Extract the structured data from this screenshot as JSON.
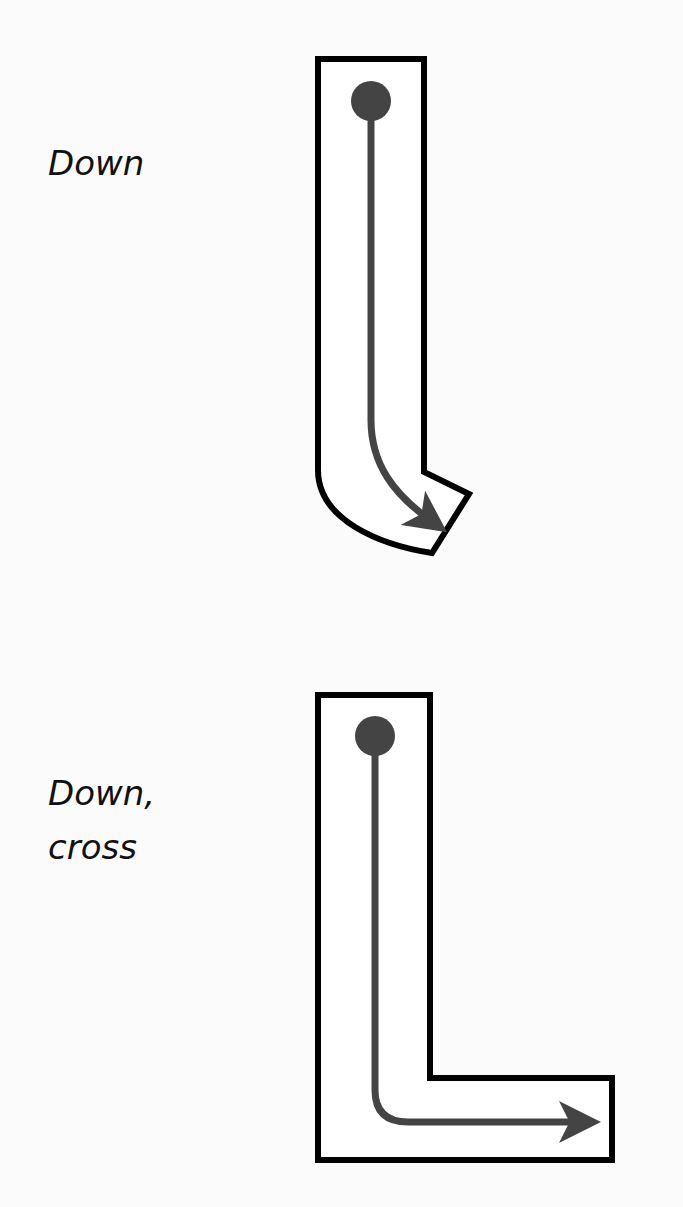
{
  "gestures": [
    {
      "label": "Down",
      "shape": "j-hook",
      "path_direction": "down then curving right-down",
      "stroke_color": "#000000",
      "arrow_color": "#444444"
    },
    {
      "label_lines": [
        "Down,",
        "cross"
      ],
      "shape": "l-shape",
      "path_direction": "down then right",
      "stroke_color": "#000000",
      "arrow_color": "#444444"
    }
  ],
  "colors": {
    "background": "#fbfbfb",
    "outline": "#000000",
    "fill": "#ffffff",
    "arrow": "#444444"
  }
}
